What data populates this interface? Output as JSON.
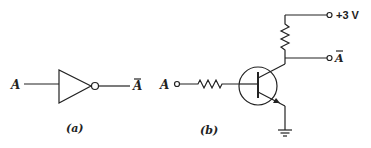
{
  "figure_a": {
    "input_label": "A",
    "output_label": "A",
    "output_bar": true,
    "caption": "(a)",
    "component": "inverter-gate"
  },
  "figure_b": {
    "input_label": "A",
    "output_label": "A",
    "output_bar": true,
    "supply_label": "+3 V",
    "caption": "(b)",
    "components": [
      "base-resistor",
      "npn-transistor",
      "collector-resistor",
      "ground"
    ]
  },
  "colors": {
    "line": "#222222",
    "background": "#ffffff"
  }
}
